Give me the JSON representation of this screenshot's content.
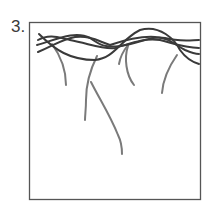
{
  "figure": {
    "number_label": "3.",
    "colors": {
      "frame": "#555555",
      "dark_strand": "#3a3a3a",
      "light_strand": "#7a7a7a",
      "background": "#ffffff"
    }
  }
}
